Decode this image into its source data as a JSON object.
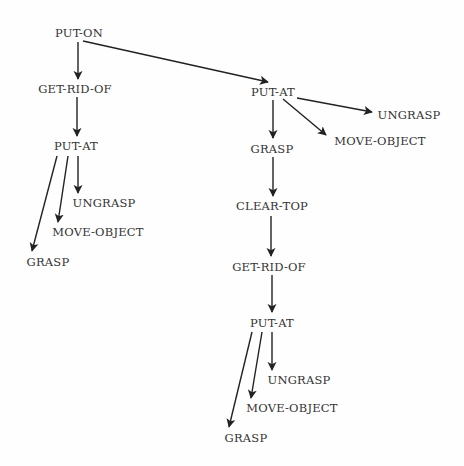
{
  "diagram": {
    "type": "tree",
    "nodes": [
      {
        "id": "put_on",
        "label": "PUT-ON",
        "x": 79,
        "y": 33
      },
      {
        "id": "get_rid_of_1",
        "label": "GET-RID-OF",
        "x": 75,
        "y": 89
      },
      {
        "id": "put_at_1",
        "label": "PUT-AT",
        "x": 76,
        "y": 146
      },
      {
        "id": "ungrasp_1",
        "label": "UNGRASP",
        "x": 104,
        "y": 203
      },
      {
        "id": "move_object_1",
        "label": "MOVE-OBJECT",
        "x": 98,
        "y": 232
      },
      {
        "id": "grasp_1",
        "label": "GRASP",
        "x": 48,
        "y": 262
      },
      {
        "id": "put_at_2",
        "label": "PUT-AT",
        "x": 273,
        "y": 92
      },
      {
        "id": "ungrasp_2",
        "label": "UNGRASP",
        "x": 409,
        "y": 115
      },
      {
        "id": "move_object_2",
        "label": "MOVE-OBJECT",
        "x": 380,
        "y": 141
      },
      {
        "id": "grasp_2",
        "label": "GRASP",
        "x": 272,
        "y": 149
      },
      {
        "id": "clear_top",
        "label": "CLEAR-TOP",
        "x": 272,
        "y": 206
      },
      {
        "id": "get_rid_of_2",
        "label": "GET-RID-OF",
        "x": 269,
        "y": 267
      },
      {
        "id": "put_at_3",
        "label": "PUT-AT",
        "x": 272,
        "y": 323
      },
      {
        "id": "ungrasp_3",
        "label": "UNGRASP",
        "x": 299,
        "y": 380
      },
      {
        "id": "move_object_3",
        "label": "MOVE-OBJECT",
        "x": 292,
        "y": 408
      },
      {
        "id": "grasp_3",
        "label": "GRASP",
        "x": 246,
        "y": 438
      }
    ],
    "edges": [
      {
        "from": "put_on",
        "to": "get_rid_of_1",
        "x1": 78,
        "y1": 42,
        "x2": 78,
        "y2": 79
      },
      {
        "from": "put_on",
        "to": "put_at_2",
        "x1": 83,
        "y1": 41,
        "x2": 268,
        "y2": 82
      },
      {
        "from": "get_rid_of_1",
        "to": "put_at_1",
        "x1": 77,
        "y1": 97,
        "x2": 77,
        "y2": 136
      },
      {
        "from": "put_at_1",
        "to": "ungrasp_1",
        "x1": 78,
        "y1": 156,
        "x2": 78,
        "y2": 193
      },
      {
        "from": "put_at_1",
        "to": "move_object_1",
        "x1": 68,
        "y1": 156,
        "x2": 58,
        "y2": 222
      },
      {
        "from": "put_at_1",
        "to": "grasp_1",
        "x1": 57,
        "y1": 156,
        "x2": 32,
        "y2": 251
      },
      {
        "from": "put_at_2",
        "to": "ungrasp_2",
        "x1": 297,
        "y1": 98,
        "x2": 372,
        "y2": 112
      },
      {
        "from": "put_at_2",
        "to": "move_object_2",
        "x1": 283,
        "y1": 99,
        "x2": 326,
        "y2": 135
      },
      {
        "from": "put_at_2",
        "to": "grasp_2",
        "x1": 273,
        "y1": 100,
        "x2": 273,
        "y2": 138
      },
      {
        "from": "grasp_2",
        "to": "clear_top",
        "x1": 273,
        "y1": 157,
        "x2": 273,
        "y2": 196
      },
      {
        "from": "clear_top",
        "to": "get_rid_of_2",
        "x1": 271,
        "y1": 216,
        "x2": 271,
        "y2": 256
      },
      {
        "from": "get_rid_of_2",
        "to": "put_at_3",
        "x1": 272,
        "y1": 275,
        "x2": 272,
        "y2": 312
      },
      {
        "from": "put_at_3",
        "to": "ungrasp_3",
        "x1": 272,
        "y1": 332,
        "x2": 272,
        "y2": 370
      },
      {
        "from": "put_at_3",
        "to": "move_object_3",
        "x1": 262,
        "y1": 332,
        "x2": 251,
        "y2": 398
      },
      {
        "from": "put_at_3",
        "to": "grasp_3",
        "x1": 252,
        "y1": 332,
        "x2": 229,
        "y2": 427
      }
    ]
  },
  "colors": {
    "line": "#222222",
    "text": "#333333",
    "background": "#fefefe"
  }
}
